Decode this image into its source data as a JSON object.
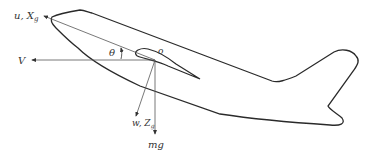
{
  "diagram": {
    "type": "aircraft-force-diagram",
    "labels": {
      "body_x_axis": "u, X",
      "body_x_sub": "g",
      "velocity": "V",
      "pitch_angle": "θ",
      "origin": "o",
      "body_z_axis": "w, Z",
      "body_z_sub": "g",
      "weight": "mg"
    },
    "colors": {
      "outline": "#2a2a2a",
      "axes": "#555555",
      "background": "#ffffff"
    }
  }
}
